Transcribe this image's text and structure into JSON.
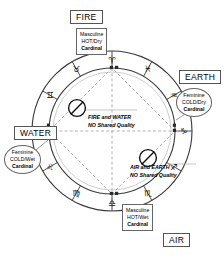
{
  "diagram": {
    "elements": [
      {
        "key": "fire",
        "label": "FIRE",
        "gender": "Masculine",
        "quality_pair": "HOT/Dry",
        "modality": "Cardinal"
      },
      {
        "key": "earth",
        "label": "EARTH",
        "gender": "Feminine",
        "quality_pair": "COLD/Dry",
        "modality": "Cardinal"
      },
      {
        "key": "water",
        "label": "WATER",
        "gender": "Feminine",
        "quality_pair": "COLD/Wet",
        "modality": "Cardinal"
      },
      {
        "key": "air",
        "label": "AIR",
        "gender": "Masculine",
        "quality_pair": "HOT/Wet",
        "modality": "Cardinal"
      }
    ],
    "notes": [
      {
        "key": "fire-water",
        "line1": "FIRE and WATER",
        "line2": "NO Shared Quality"
      },
      {
        "key": "air-earth",
        "line1": "AIR and EARTH",
        "line2": "NO Shared Quality"
      }
    ],
    "prohibition_icons": [
      {
        "key": "fire-water-no",
        "name": "no-entry-icon"
      },
      {
        "key": "air-earth-no",
        "name": "no-entry-icon"
      }
    ],
    "zodiac_signs": [
      {
        "name": "aries",
        "glyph": "♈",
        "angle": -90
      },
      {
        "name": "taurus",
        "glyph": "♉",
        "angle": -120
      },
      {
        "name": "gemini",
        "glyph": "♊",
        "angle": -150
      },
      {
        "name": "cancer",
        "glyph": "♋",
        "angle": 180
      },
      {
        "name": "leo",
        "glyph": "♌",
        "angle": 150
      },
      {
        "name": "virgo",
        "glyph": "♍",
        "angle": 120
      },
      {
        "name": "libra",
        "glyph": "♎",
        "angle": 90
      },
      {
        "name": "scorpio",
        "glyph": "♏",
        "angle": 60
      },
      {
        "name": "sagittarius",
        "glyph": "♐",
        "angle": 30
      },
      {
        "name": "capricorn",
        "glyph": "♑",
        "angle": 0
      },
      {
        "name": "aquarius",
        "glyph": "♒",
        "angle": -30
      },
      {
        "name": "pisces",
        "glyph": "♓",
        "angle": -60
      }
    ],
    "colors": {
      "stroke": "#3a3a3a",
      "aspect_line": "#8a8a8a",
      "background": "#ffffff",
      "text": "#000000"
    }
  }
}
